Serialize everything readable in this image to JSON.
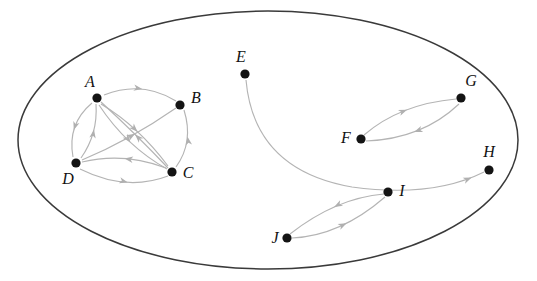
{
  "figure": {
    "background_color": "#ffffff",
    "vertex_color": "#141414",
    "edge_color": "#b4b4b4",
    "boundary_color": "#3a3a3a"
  },
  "boundary": {
    "shape": "ellipse",
    "center_x": 268,
    "center_y": 140,
    "radius_x": 250,
    "radius_y": 129
  },
  "graph_data": {
    "type": "directed-graph",
    "vertex_count": 10,
    "edge_count": 15,
    "component_count": 3,
    "vertices": [
      {
        "id": "A",
        "label": "A",
        "x": 97,
        "y": 98,
        "label_x": 90,
        "label_y": 87,
        "label_anchor": "middle"
      },
      {
        "id": "B",
        "label": "B",
        "x": 180,
        "y": 105,
        "label_x": 196,
        "label_y": 103,
        "label_anchor": "middle"
      },
      {
        "id": "C",
        "label": "C",
        "x": 172,
        "y": 172,
        "label_x": 188,
        "label_y": 178,
        "label_anchor": "middle"
      },
      {
        "id": "D",
        "label": "D",
        "x": 76,
        "y": 163,
        "label_x": 68,
        "label_y": 184,
        "label_anchor": "middle"
      },
      {
        "id": "E",
        "label": "E",
        "x": 245,
        "y": 74,
        "label_x": 241,
        "label_y": 62,
        "label_anchor": "middle"
      },
      {
        "id": "F",
        "label": "F",
        "x": 361,
        "y": 139,
        "label_x": 346,
        "label_y": 143,
        "label_anchor": "middle"
      },
      {
        "id": "G",
        "label": "G",
        "x": 461,
        "y": 98,
        "label_x": 471,
        "label_y": 86,
        "label_anchor": "middle"
      },
      {
        "id": "H",
        "label": "H",
        "x": 489,
        "y": 170,
        "label_x": 489,
        "label_y": 157,
        "label_anchor": "middle"
      },
      {
        "id": "I",
        "label": "I",
        "x": 388,
        "y": 192,
        "label_x": 402,
        "label_y": 196,
        "label_anchor": "middle"
      },
      {
        "id": "J",
        "label": "J",
        "x": 287,
        "y": 238,
        "label_x": 275,
        "label_y": 243,
        "label_anchor": "middle"
      }
    ],
    "edges": [
      {
        "from": "A",
        "to": "B",
        "curvature": "arc-up",
        "path": "M 104 95 Q 142 80 176 101",
        "head_t": 0.52,
        "head_angle": 10
      },
      {
        "from": "A",
        "to": "D",
        "curvature": "arc-left",
        "path": "M 92 103 Q 67 124 73 157",
        "head_t": 0.55,
        "head_angle": 108
      },
      {
        "from": "D",
        "to": "A",
        "curvature": "arc-inner",
        "path": "M 81 158 Q 98 134 96 104",
        "head_t": 0.55,
        "head_angle": -80
      },
      {
        "from": "A",
        "to": "C",
        "curvature": "arc-slight",
        "path": "M 101 104 Q 138 126 168 166",
        "head_t": 0.5,
        "head_angle": 45
      },
      {
        "from": "A",
        "to": "C",
        "curvature": "arc-second",
        "path": "M 99 105 Q 126 146 167 169",
        "head_t": 0.52,
        "head_angle": 52
      },
      {
        "from": "C",
        "to": "A",
        "curvature": "arc-return",
        "path": "M 168 168 Q 138 136 101 102",
        "head_t": 0.5,
        "head_angle": -135
      },
      {
        "from": "C",
        "to": "B",
        "curvature": "arc-right",
        "path": "M 176 167 Q 194 142 184 110",
        "head_t": 0.55,
        "head_angle": -100
      },
      {
        "from": "D",
        "to": "B",
        "curvature": "arc-diagonal",
        "path": "M 82 160 Q 130 140 176 108",
        "head_t": 0.55,
        "head_angle": -30
      },
      {
        "from": "D",
        "to": "C",
        "curvature": "arc-lower",
        "path": "M 80 169 Q 126 192 168 176",
        "head_t": 0.55,
        "head_angle": 15
      },
      {
        "from": "C",
        "to": "D",
        "curvature": "arc-upper",
        "path": "M 166 168 Q 124 152 82 162",
        "head_t": 0.5,
        "head_angle": 188
      },
      {
        "from": "E",
        "to": "H",
        "curvature": "long-sweep",
        "path": "M 246 80 Q 254 170 352 187 Q 432 198 484 172",
        "head_t": 0.955,
        "head_angle": -22
      },
      {
        "from": "F",
        "to": "G",
        "curvature": "arc-up",
        "path": "M 364 135 Q 400 104 456 99",
        "head_t": 0.5,
        "head_angle": -22
      },
      {
        "from": "G",
        "to": "F",
        "curvature": "arc-down",
        "path": "M 459 104 Q 422 139 366 141",
        "head_t": 0.52,
        "head_angle": 160
      },
      {
        "from": "J",
        "to": "I",
        "curvature": "arc-lower",
        "path": "M 292 238 Q 340 236 385 197",
        "head_t": 0.55,
        "head_angle": -26
      },
      {
        "from": "I",
        "to": "J",
        "curvature": "arc-upper",
        "path": "M 384 194 Q 336 198 290 234",
        "head_t": 0.5,
        "head_angle": 152
      }
    ],
    "components": [
      {
        "name": "cluster-abcd",
        "vertices": [
          "A",
          "B",
          "C",
          "D"
        ]
      },
      {
        "name": "cluster-efgh",
        "vertices": [
          "E",
          "F",
          "G",
          "H"
        ]
      },
      {
        "name": "cluster-ij",
        "vertices": [
          "I",
          "J"
        ]
      }
    ]
  }
}
